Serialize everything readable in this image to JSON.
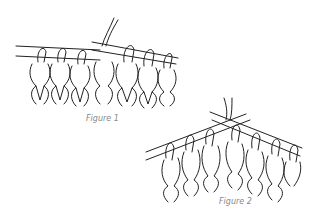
{
  "figures": [
    {
      "id": "figure-1",
      "caption": "Figure 1",
      "description": "Knitting needle with stitches; working needle inserted from the right with yarn"
    },
    {
      "id": "figure-2",
      "caption": "Figure 2",
      "description": "Diagonal needle holding stitches, yarn wrapped over needle"
    }
  ],
  "colors": {
    "line": "#222222",
    "caption": "#888888",
    "background": "#ffffff"
  }
}
